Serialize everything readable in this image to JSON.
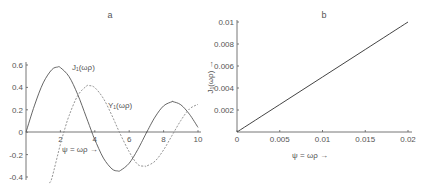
{
  "chart_data": [
    {
      "type": "line",
      "panel": "a",
      "title": "a",
      "xlabel": "ψ = ωρ →",
      "ylabel": "",
      "xlim": [
        0,
        10
      ],
      "ylim": [
        -0.4,
        0.6
      ],
      "x_ticks": [
        2,
        4,
        6,
        8,
        10
      ],
      "x_tick_labels": [
        "2",
        "4",
        "6",
        "8",
        "10"
      ],
      "y_ticks": [
        0.6,
        0.4,
        0.2,
        0,
        -0.2,
        -0.4
      ],
      "y_tick_labels": [
        "0.6",
        "0.4",
        "0.2",
        "0",
        "-0.2",
        "-0.4"
      ],
      "grid": false,
      "series": [
        {
          "name": "J₁(ωρ)",
          "style": "solid",
          "x": [
            0,
            0.5,
            1,
            1.5,
            1.84,
            2,
            2.5,
            3,
            3.5,
            3.83,
            4,
            4.5,
            5,
            5.33,
            5.5,
            6,
            6.5,
            7,
            7.02,
            7.5,
            8,
            8.5,
            8.54,
            9,
            9.5,
            10
          ],
          "y": [
            0,
            0.242,
            0.44,
            0.558,
            0.582,
            0.577,
            0.497,
            0.339,
            0.137,
            0.0,
            -0.066,
            -0.231,
            -0.328,
            -0.346,
            -0.341,
            -0.277,
            -0.154,
            -0.005,
            0.0,
            0.135,
            0.235,
            0.273,
            0.273,
            0.245,
            0.161,
            0.043
          ]
        },
        {
          "name": "Y₁(ωρ)",
          "style": "dashed",
          "x": [
            1.35,
            1.5,
            2,
            2.2,
            2.5,
            3,
            3.5,
            3.68,
            4,
            4.5,
            5,
            5.43,
            6,
            6.5,
            6.94,
            7,
            7.5,
            8,
            8.5,
            9,
            9.5,
            10
          ],
          "y": [
            -0.45,
            -0.412,
            -0.107,
            0.0,
            0.146,
            0.325,
            0.41,
            0.416,
            0.398,
            0.301,
            0.148,
            0.0,
            -0.175,
            -0.288,
            -0.303,
            -0.303,
            -0.259,
            -0.158,
            -0.027,
            0.104,
            0.207,
            0.249
          ]
        }
      ],
      "annotations": [
        "J₁(ωρ)",
        "Y₁(ωρ)",
        "ψ = ωρ →"
      ]
    },
    {
      "type": "line",
      "panel": "b",
      "title": "b",
      "xlabel": "ψ = ωρ →",
      "ylabel": "J₁(ωρ) →",
      "xlim": [
        0,
        0.02
      ],
      "ylim": [
        0,
        0.01
      ],
      "x_ticks": [
        0,
        0.005,
        0.01,
        0.015,
        0.02
      ],
      "x_tick_labels": [
        "0",
        "0.005",
        "0.01",
        "0.015",
        "0.02"
      ],
      "y_ticks": [
        0.01,
        0.008,
        0.006,
        0.004,
        0.002
      ],
      "y_tick_labels": [
        "0.01",
        "0.008",
        "0.006",
        "0.004",
        "0.002"
      ],
      "grid": false,
      "series": [
        {
          "name": "J₁(ωρ)",
          "style": "solid",
          "x": [
            0,
            0.005,
            0.01,
            0.015,
            0.02
          ],
          "y": [
            0,
            0.0025,
            0.005,
            0.0075,
            0.01
          ]
        }
      ]
    }
  ]
}
